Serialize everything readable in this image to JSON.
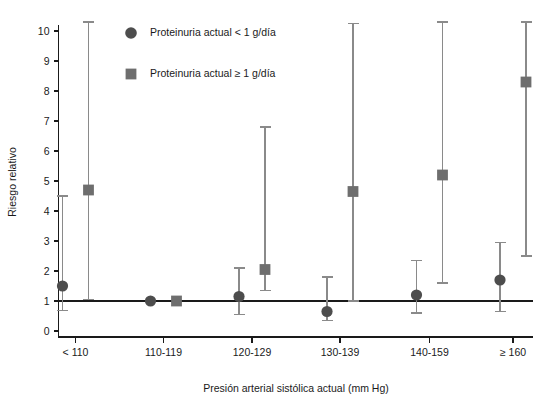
{
  "chart_data": {
    "type": "scatter",
    "title": "",
    "xlabel": "Presión arterial sistólica actual (mm Hg)",
    "ylabel": "Riesgo relativo",
    "categories": [
      "< 110",
      "110-119",
      "120-129",
      "130-139",
      "140-159",
      "≥ 160"
    ],
    "ylim": [
      0,
      10.5
    ],
    "yticks": [
      0,
      1,
      2,
      3,
      4,
      5,
      6,
      7,
      8,
      9,
      10
    ],
    "ytick_labels": [
      "0",
      "1",
      "2",
      "3",
      "4",
      "5",
      "6",
      "7",
      "8",
      "9",
      "10"
    ],
    "grid": false,
    "reference_line": 1,
    "legend_position": "top-left-inside",
    "series": [
      {
        "name": "Proteinuria actual < 1 g/día",
        "marker": "circle",
        "color": "#4d4d4d",
        "values": [
          1.5,
          1.0,
          1.15,
          0.65,
          1.2,
          1.7
        ],
        "ci_low": [
          0.68,
          null,
          0.55,
          0.35,
          0.6,
          0.65
        ],
        "ci_high": [
          4.5,
          null,
          2.1,
          1.8,
          2.35,
          2.95
        ]
      },
      {
        "name": "Proteinuria actual ≥ 1 g/día",
        "marker": "square",
        "color": "#6e6e6e",
        "values": [
          4.7,
          1.0,
          2.05,
          4.65,
          5.2,
          8.3
        ],
        "ci_low": [
          1.05,
          null,
          1.35,
          1.0,
          1.6,
          2.5
        ],
        "ci_high": [
          10.3,
          null,
          6.8,
          10.25,
          10.3,
          10.3
        ]
      }
    ]
  },
  "legend": {
    "items": [
      {
        "label": "Proteinuria actual < 1 g/día",
        "marker": "circle-marker-icon",
        "color": "#4d4d4d"
      },
      {
        "label": "Proteinuria actual ≥ 1 g/día",
        "marker": "square-marker-icon",
        "color": "#6e6e6e"
      }
    ]
  }
}
